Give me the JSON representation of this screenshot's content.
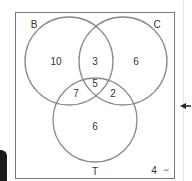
{
  "diagram": {
    "type": "venn",
    "sets": [
      {
        "name": "B",
        "label": "B"
      },
      {
        "name": "C",
        "label": "C"
      },
      {
        "name": "T",
        "label": "T"
      }
    ],
    "regions": {
      "B_only": "10",
      "B_and_C_only": "3",
      "C_only": "6",
      "B_and_C_and_T": "5",
      "B_and_T_only": "7",
      "C_and_T_only": "2",
      "T_only": "6",
      "outside": "4"
    },
    "corner_note": "ξ",
    "colors": {
      "circle_stroke": "#8a8a8a",
      "frame_stroke": "#777777",
      "text": "#333333"
    }
  }
}
